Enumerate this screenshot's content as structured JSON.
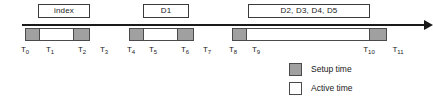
{
  "diagram": {
    "axis": {
      "name": "time-axis",
      "arrow_direction": "right"
    },
    "colors": {
      "setup": "#a0a0a0",
      "active": "#ffffff",
      "stroke": "#4a4a4a",
      "axis": "#1a1a1a"
    },
    "tasks": [
      {
        "label": "index",
        "box_x": 38,
        "box_w": 52
      },
      {
        "label": "D1",
        "box_x": 143,
        "box_w": 46
      },
      {
        "label": "D2, D3, D4, D5",
        "box_x": 248,
        "box_w": 122
      }
    ],
    "bars": [
      {
        "name": "bar-index",
        "x": 25,
        "w": 65,
        "segments": [
          {
            "kind": "setup",
            "w": 14
          },
          {
            "kind": "active",
            "w": 35
          },
          {
            "kind": "setup",
            "w": 16
          }
        ]
      },
      {
        "name": "bar-d1",
        "x": 129,
        "w": 65,
        "segments": [
          {
            "kind": "setup",
            "w": 14
          },
          {
            "kind": "active",
            "w": 35
          },
          {
            "kind": "setup",
            "w": 16
          }
        ]
      },
      {
        "name": "bar-d2-d5",
        "x": 232,
        "w": 155,
        "segments": [
          {
            "kind": "setup",
            "w": 14
          },
          {
            "kind": "active",
            "w": 124
          },
          {
            "kind": "setup",
            "w": 17
          }
        ]
      }
    ],
    "ticks": [
      {
        "base": "T",
        "sub": "0",
        "x": 25
      },
      {
        "base": "T",
        "sub": "1",
        "x": 50
      },
      {
        "base": "T",
        "sub": "2",
        "x": 82
      },
      {
        "base": "T",
        "sub": "3",
        "x": 104
      },
      {
        "base": "T",
        "sub": "4",
        "x": 131
      },
      {
        "base": "T",
        "sub": "5",
        "x": 153
      },
      {
        "base": "T",
        "sub": "6",
        "x": 185
      },
      {
        "base": "T",
        "sub": "7",
        "x": 207
      },
      {
        "base": "T",
        "sub": "8",
        "x": 233
      },
      {
        "base": "T",
        "sub": "9",
        "x": 256
      },
      {
        "base": "T",
        "sub": "10",
        "x": 369
      },
      {
        "base": "T",
        "sub": "11",
        "x": 398
      }
    ],
    "legend": {
      "items": [
        {
          "name": "legend-setup-time",
          "label": "Setup time",
          "kind": "setup"
        },
        {
          "name": "legend-active-time",
          "label": "Active time",
          "kind": "active"
        }
      ]
    }
  }
}
